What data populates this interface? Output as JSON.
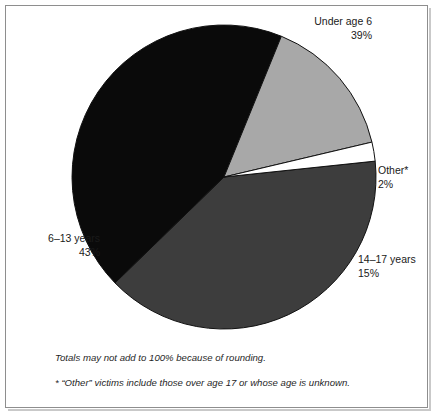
{
  "figure": {
    "frame_border_color": "#8e8e8e",
    "background_color": "#ffffff"
  },
  "chart_data": {
    "type": "pie",
    "title": "",
    "subtitle": "",
    "xlabel": "",
    "ylabel": "",
    "legend_position": "none",
    "grid": false,
    "units": "percent",
    "start_angle_deg": -6,
    "direction": "clockwise",
    "categories": [
      "Under age 6",
      "6–13 years",
      "14–17 years",
      "Other*"
    ],
    "values": [
      39,
      43,
      15,
      2
    ],
    "colors": [
      "#3d3d3d",
      "#0a0a0a",
      "#a8a8a8",
      "#ffffff"
    ],
    "slices": [
      {
        "label": "Under age 6",
        "percent_text": "39%",
        "value": 39,
        "color": "#3d3d3d",
        "label_align": "right"
      },
      {
        "label": "6–13 years",
        "percent_text": "43%",
        "value": 43,
        "color": "#0a0a0a",
        "label_align": "right"
      },
      {
        "label": "14–17 years",
        "percent_text": "15%",
        "value": 15,
        "color": "#a8a8a8",
        "label_align": "left"
      },
      {
        "label": "Other*",
        "percent_text": "2%",
        "value": 2,
        "color": "#ffffff",
        "label_align": "left"
      }
    ],
    "annotations": [
      "Totals may not add to 100% because of rounding.",
      "* “Other” victims include those over age 17 or whose age is unknown."
    ],
    "geometry": {
      "center_x": 224,
      "center_y": 177,
      "radius": 152
    }
  },
  "footnotes": {
    "rounding": "Totals may not add to 100% because of rounding.",
    "other_definition": "* “Other” victims include those over age 17 or whose age is unknown."
  }
}
